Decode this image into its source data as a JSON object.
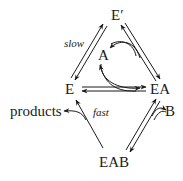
{
  "diagram": {
    "nodes": {
      "e_prime": "E′",
      "a": "A",
      "e": "E",
      "ea": "EA",
      "b": "B",
      "products": "products",
      "eab": "EAB"
    },
    "edge_labels": {
      "slow": "slow",
      "fast": "fast"
    },
    "colors": {
      "ink": "#1a1a1a",
      "background": "#ffffff"
    }
  }
}
